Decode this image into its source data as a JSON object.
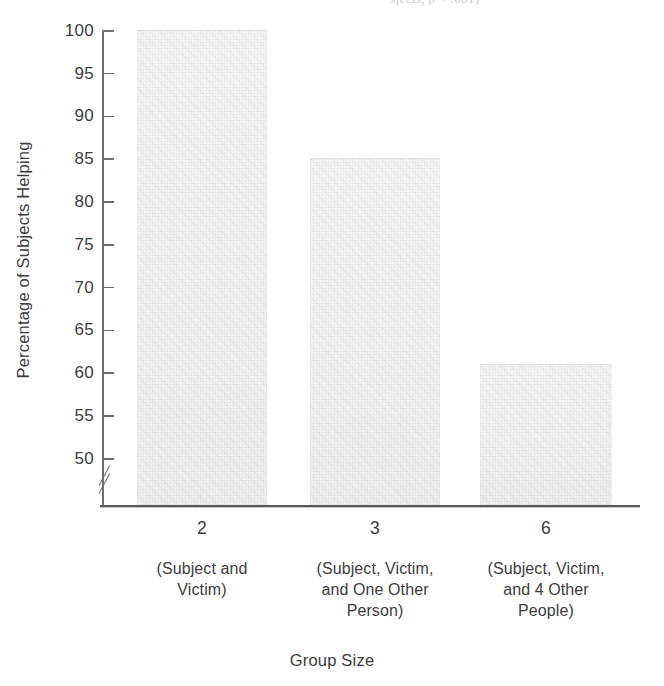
{
  "figure": {
    "cropped_caption_fragment": "sjects, p < .001)",
    "x_axis_title": "Group Size",
    "y_axis_title": "Percentage of Subjects Helping"
  },
  "chart_data": {
    "type": "bar",
    "title": "",
    "subtitle": "",
    "xlabel": "Group Size",
    "ylabel": "Percentage of Subjects Helping",
    "categories": [
      "2",
      "3",
      "6"
    ],
    "category_descriptions": [
      [
        "(Subject and",
        "Victim)"
      ],
      [
        "(Subject, Victim,",
        "and One Other",
        "Person)"
      ],
      [
        "(Subject, Victim,",
        "and 4 Other",
        "People)"
      ]
    ],
    "values": [
      100,
      85,
      61
    ],
    "value_unit": "%",
    "ylim": [
      48,
      100
    ],
    "y_axis_break": true,
    "y_axis_break_below": 50,
    "ytick_labels": [
      "100",
      "95",
      "90",
      "85",
      "80",
      "75",
      "70",
      "65",
      "60",
      "55",
      "50"
    ],
    "ytick_values": [
      100,
      95,
      90,
      85,
      80,
      75,
      70,
      65,
      60,
      55,
      50
    ],
    "grid": false,
    "legend": false,
    "legend_position": "none",
    "bar_fill_color": "#f7f7f7",
    "axis_color": "#6e6e6e",
    "text_color": "#3d3d3d",
    "series": [
      {
        "name": "Percentage of Subjects Helping",
        "values": [
          100,
          85,
          61
        ]
      }
    ]
  }
}
